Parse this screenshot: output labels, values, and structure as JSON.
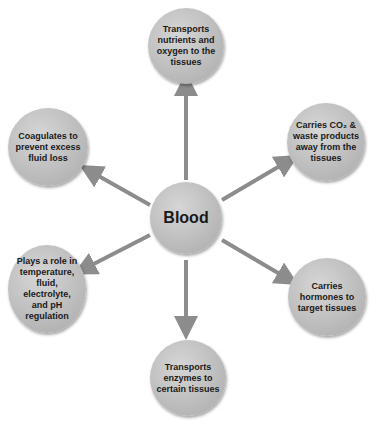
{
  "diagram": {
    "center": {
      "label": "Blood"
    },
    "nodes": [
      {
        "id": "top",
        "label": "Transports nutrients and oxygen to the tissues"
      },
      {
        "id": "upper-right",
        "label": "Carries CO₂ & waste products away from the tissues"
      },
      {
        "id": "lower-right",
        "label": "Carries hormones to target tissues"
      },
      {
        "id": "bottom",
        "label": "Transports enzymes to certain tissues"
      },
      {
        "id": "lower-left",
        "label": "Plays a role in temperature, fluid, electrolyte, and pH regulation"
      },
      {
        "id": "upper-left",
        "label": "Coagulates to prevent excess fluid loss"
      }
    ],
    "colors": {
      "node_fill": "#c2c2c2",
      "arrow": "#8c8c8c",
      "text": "#1a1a1a"
    }
  }
}
